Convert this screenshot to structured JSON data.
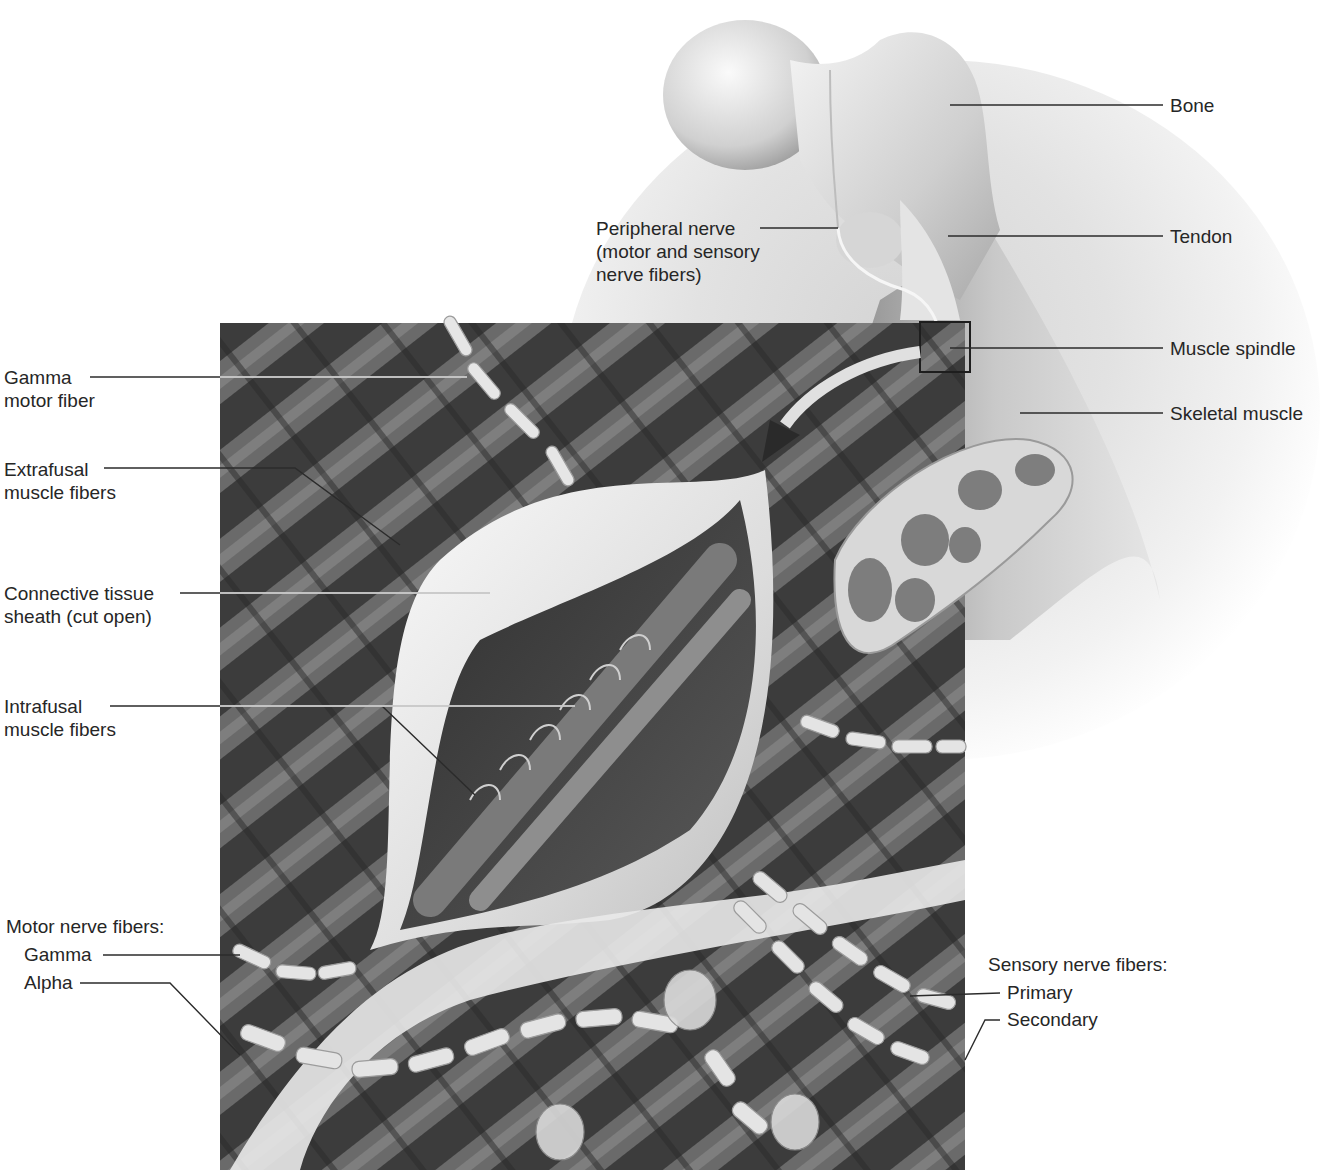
{
  "figure": {
    "colors": {
      "background": "#ffffff",
      "text": "#262626",
      "leader_line": "#2b2b2b",
      "muscle_dark": "#3a3a3a",
      "sheath": "#e8e8e8"
    }
  },
  "labels": {
    "bone": "Bone",
    "tendon": "Tendon",
    "muscle_spindle": "Muscle spindle",
    "skeletal_muscle": "Skeletal muscle",
    "peripheral_nerve": [
      "Peripheral nerve",
      "(motor and sensory",
      "nerve fibers)"
    ],
    "gamma_motor_fiber": [
      "Gamma",
      "motor fiber"
    ],
    "extrafusal": [
      "Extrafusal",
      "muscle fibers"
    ],
    "connective_tissue": [
      "Connective tissue",
      "sheath (cut open)"
    ],
    "intrafusal": [
      "Intrafusal",
      "muscle fibers"
    ],
    "motor_nerve_fibers": {
      "heading": "Motor nerve fibers:",
      "gamma": "Gamma",
      "alpha": "Alpha"
    },
    "sensory_nerve_fibers": {
      "heading": "Sensory nerve fibers:",
      "primary": "Primary",
      "secondary": "Secondary"
    }
  }
}
